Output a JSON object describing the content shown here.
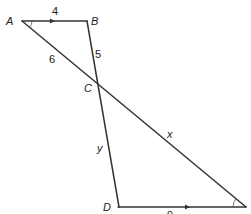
{
  "diagram": {
    "points": {
      "A": {
        "label": "A",
        "x": 22,
        "y": 21
      },
      "B": {
        "label": "B",
        "x": 87,
        "y": 21
      },
      "C": {
        "label": "C",
        "x": 96,
        "y": 84
      },
      "D": {
        "label": "D",
        "x": 118,
        "y": 207
      },
      "E": {
        "label": "",
        "x": 246,
        "y": 207
      }
    },
    "segments": [
      {
        "from": "A",
        "to": "B",
        "label": "4",
        "arrow": true
      },
      {
        "from": "B",
        "to": "C",
        "label": "5"
      },
      {
        "from": "A",
        "to": "C",
        "label": "6"
      },
      {
        "from": "C",
        "to": "E",
        "label": "x"
      },
      {
        "from": "C",
        "to": "D",
        "label": "y"
      },
      {
        "from": "D",
        "to": "E",
        "label": "9",
        "arrow": true
      }
    ],
    "labels": {
      "A": "A",
      "B": "B",
      "C": "C",
      "D": "D",
      "ab": "4",
      "bc": "5",
      "ac": "6",
      "ce": "x",
      "cd": "y",
      "de": "9"
    },
    "angle_marks": [
      "A",
      "E"
    ],
    "colors": {
      "line": "#333333",
      "text": "#222222",
      "background": "#ffffff"
    }
  }
}
